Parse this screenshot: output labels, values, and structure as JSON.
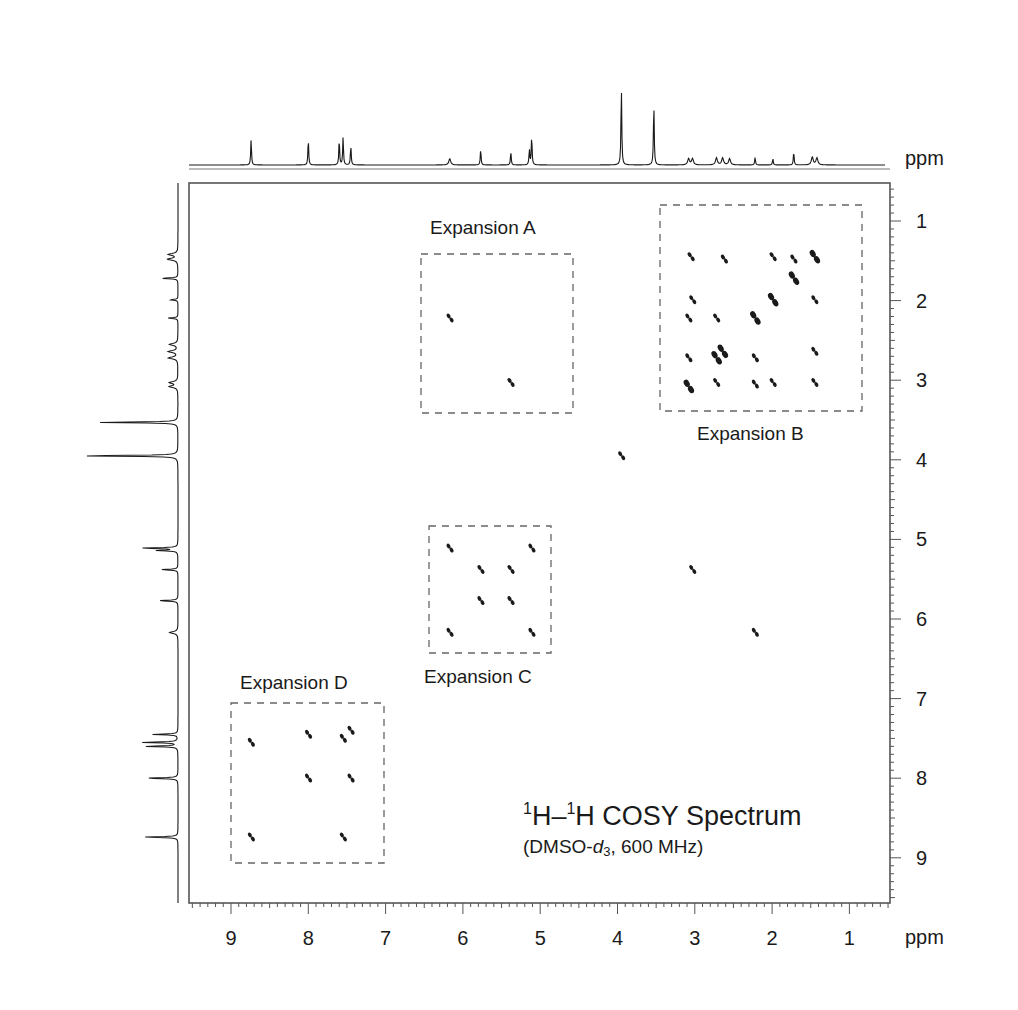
{
  "chart_data": {
    "type": "heatmap",
    "subtype": "2D NMR COSY contour plot with 1D projections",
    "title": "1H–1H COSY Spectrum",
    "title_parts": {
      "iso1": "1",
      "el1": "H",
      "dash": "–",
      "iso2": "1",
      "el2": "H",
      "rest": " COSY Spectrum"
    },
    "subtitle": "(DMSO-d3, 600 MHz)",
    "subtitle_parts": {
      "open": "(DMSO-",
      "d": "d",
      "sub": "3",
      "close": ", 600 MHz)"
    },
    "xlabel": "ppm",
    "ylabel": "ppm",
    "xlim": [
      9.55,
      0.45
    ],
    "ylim": [
      0.55,
      9.55
    ],
    "x_reversed": true,
    "y_reversed": true,
    "x_ticks": [
      9,
      8,
      7,
      6,
      5,
      4,
      3,
      2,
      1
    ],
    "y_ticks": [
      1,
      2,
      3,
      4,
      5,
      6,
      7,
      8,
      9
    ],
    "minor_tick_step": 0.1,
    "grid": false,
    "projection_1d_peaks": [
      {
        "ppm": 8.74,
        "height": 0.33
      },
      {
        "ppm": 8.0,
        "height": 0.33
      },
      {
        "ppm": 7.6,
        "height": 0.33
      },
      {
        "ppm": 7.55,
        "height": 0.36
      },
      {
        "ppm": 7.45,
        "height": 0.25
      },
      {
        "ppm": 6.17,
        "height": 0.08,
        "multiplet": true
      },
      {
        "ppm": 5.77,
        "height": 0.2
      },
      {
        "ppm": 5.38,
        "height": 0.17
      },
      {
        "ppm": 5.14,
        "height": 0.2
      },
      {
        "ppm": 5.11,
        "height": 0.37
      },
      {
        "ppm": 3.95,
        "height": 1.0
      },
      {
        "ppm": 3.53,
        "height": 0.79
      },
      {
        "ppm": 3.08,
        "height": 0.08,
        "multiplet": true
      },
      {
        "ppm": 3.03,
        "height": 0.08,
        "multiplet": true
      },
      {
        "ppm": 2.72,
        "height": 0.09,
        "multiplet": true
      },
      {
        "ppm": 2.64,
        "height": 0.09,
        "multiplet": true
      },
      {
        "ppm": 2.55,
        "height": 0.08,
        "multiplet": true
      },
      {
        "ppm": 2.22,
        "height": 0.1
      },
      {
        "ppm": 1.99,
        "height": 0.08
      },
      {
        "ppm": 1.72,
        "height": 0.17
      },
      {
        "ppm": 1.48,
        "height": 0.1,
        "multiplet": true
      },
      {
        "ppm": 1.42,
        "height": 0.09,
        "multiplet": true
      }
    ],
    "cross_peaks": [
      {
        "x": 8.74,
        "y": 7.55
      },
      {
        "x": 8.0,
        "y": 7.45
      },
      {
        "x": 7.55,
        "y": 7.5
      },
      {
        "x": 7.45,
        "y": 7.4
      },
      {
        "x": 8.0,
        "y": 8.0
      },
      {
        "x": 7.45,
        "y": 8.0
      },
      {
        "x": 8.74,
        "y": 8.74
      },
      {
        "x": 7.55,
        "y": 8.74
      },
      {
        "x": 6.17,
        "y": 5.11
      },
      {
        "x": 5.11,
        "y": 5.11
      },
      {
        "x": 5.77,
        "y": 5.38
      },
      {
        "x": 5.38,
        "y": 5.38
      },
      {
        "x": 5.77,
        "y": 5.77
      },
      {
        "x": 5.38,
        "y": 5.77
      },
      {
        "x": 6.17,
        "y": 6.17
      },
      {
        "x": 5.11,
        "y": 6.17
      },
      {
        "x": 6.17,
        "y": 2.22
      },
      {
        "x": 5.38,
        "y": 3.03
      },
      {
        "x": 3.03,
        "y": 5.38
      },
      {
        "x": 2.22,
        "y": 6.17
      },
      {
        "x": 3.95,
        "y": 3.95
      },
      {
        "x": 3.05,
        "y": 1.45
      },
      {
        "x": 2.62,
        "y": 1.48
      },
      {
        "x": 1.99,
        "y": 1.45
      },
      {
        "x": 1.72,
        "y": 1.48
      },
      {
        "x": 1.45,
        "y": 1.45
      },
      {
        "x": 1.72,
        "y": 1.72
      },
      {
        "x": 3.03,
        "y": 1.99
      },
      {
        "x": 1.99,
        "y": 1.99
      },
      {
        "x": 1.45,
        "y": 1.99
      },
      {
        "x": 3.08,
        "y": 2.22
      },
      {
        "x": 2.72,
        "y": 2.22
      },
      {
        "x": 2.22,
        "y": 2.22
      },
      {
        "x": 2.64,
        "y": 2.64
      },
      {
        "x": 2.72,
        "y": 2.72
      },
      {
        "x": 3.08,
        "y": 2.72
      },
      {
        "x": 2.22,
        "y": 2.72
      },
      {
        "x": 1.45,
        "y": 2.64
      },
      {
        "x": 3.08,
        "y": 3.08
      },
      {
        "x": 2.72,
        "y": 3.03
      },
      {
        "x": 2.22,
        "y": 3.05
      },
      {
        "x": 1.99,
        "y": 3.03
      },
      {
        "x": 1.45,
        "y": 3.03
      }
    ],
    "annotations": [
      {
        "label": "Expansion A",
        "x_range": [
          6.55,
          4.55
        ],
        "y_range": [
          1.45,
          3.45
        ],
        "label_position": "above"
      },
      {
        "label": "Expansion B",
        "x_range": [
          3.45,
          0.8
        ],
        "y_range": [
          0.75,
          3.4
        ],
        "label_position": "below"
      },
      {
        "label": "Expansion C",
        "x_range": [
          6.45,
          4.85
        ],
        "y_range": [
          4.85,
          6.45
        ],
        "label_position": "below"
      },
      {
        "label": "Expansion D",
        "x_range": [
          9.0,
          7.0
        ],
        "y_range": [
          7.05,
          9.05
        ],
        "label_position": "above"
      }
    ]
  },
  "axes": {
    "x_unit": "ppm",
    "y_unit": "ppm",
    "x_tick_labels": [
      "9",
      "8",
      "7",
      "6",
      "5",
      "4",
      "3",
      "2",
      "1"
    ],
    "y_tick_labels": [
      "1",
      "2",
      "3",
      "4",
      "5",
      "6",
      "7",
      "8",
      "9"
    ]
  },
  "expansions": {
    "a": {
      "label": "Expansion A"
    },
    "b": {
      "label": "Expansion B"
    },
    "c": {
      "label": "Expansion C"
    },
    "d": {
      "label": "Expansion D"
    }
  },
  "colors": {
    "ink": "#1a1a1a",
    "frame": "#555555",
    "dashed_box": "#666666",
    "background": "#ffffff"
  }
}
